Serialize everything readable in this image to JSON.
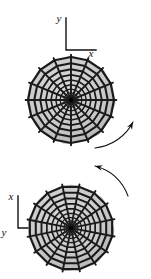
{
  "figure": {
    "background_color": "#ffffff",
    "width": 151,
    "height": 279,
    "disk_fill_color": "#cccccc",
    "disk_shade_color": "#b8b8b8",
    "web_line_color": "#1a1a1a",
    "hub_color": "#000000",
    "axis_color": "#111111",
    "arrow_color": "#111111"
  },
  "panels": [
    {
      "id": "top-panel",
      "name": "upper-web-disk",
      "center_x": 71,
      "center_y": 100,
      "radius": 43,
      "spokes": 16,
      "rings": 9,
      "rotation_deg": 0,
      "axes": {
        "origin_x": 66,
        "origin_y": 50,
        "vertical_length": 32,
        "horizontal_length": 30,
        "vertical_label": "y",
        "horizontal_label": "x",
        "vertical_label_x": 59,
        "vertical_label_y": 22,
        "horizontal_label_x": 91,
        "horizontal_label_y": 57
      }
    },
    {
      "id": "bottom-panel",
      "name": "lower-web-disk",
      "center_x": 71,
      "center_y": 228,
      "radius": 42,
      "spokes": 16,
      "rings": 9,
      "rotation_deg": 11,
      "axes": {
        "origin_x": 18,
        "origin_y": 228,
        "vertical_length": 32,
        "horizontal_length": 30,
        "vertical_label": "x",
        "horizontal_label": "y",
        "vertical_label_x": 11,
        "vertical_label_y": 200,
        "horizontal_label_x": 4,
        "horizontal_label_y": 236
      }
    }
  ],
  "arrows": [
    {
      "id": "arrow-lower-right",
      "name": "rotation-arrow-upper",
      "path": "M 95 148 C 112 146 126 136 133 122",
      "head_x": 133,
      "head_y": 122,
      "head_angle_deg": -62,
      "direction": "counterclockwise"
    },
    {
      "id": "arrow-upper-right",
      "name": "rotation-arrow-lower",
      "path": "M 128 196 C 122 180 110 170 95 166",
      "head_x": 95,
      "head_y": 166,
      "head_angle_deg": 195,
      "direction": "counterclockwise"
    }
  ],
  "chart_data": {
    "type": "diagram",
    "series": [
      {
        "name": "upper-disk",
        "spokes": 16,
        "rings": 9,
        "center": [
          71,
          100
        ],
        "radius": 43,
        "axis_vertical": "y",
        "axis_horizontal": "x"
      },
      {
        "name": "lower-disk",
        "spokes": 16,
        "rings": 9,
        "center": [
          71,
          228
        ],
        "radius": 42,
        "axis_vertical": "x",
        "axis_horizontal": "y"
      }
    ],
    "annotations": [
      "y",
      "x",
      "x",
      "y"
    ],
    "legend": "none",
    "grid": false
  }
}
